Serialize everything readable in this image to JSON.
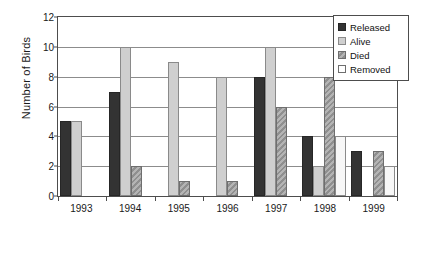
{
  "chart_data": {
    "type": "bar",
    "title": "",
    "xlabel": "",
    "ylabel": "Number of Birds",
    "categories": [
      "1993",
      "1994",
      "1995",
      "1996",
      "1997",
      "1998",
      "1999"
    ],
    "series": [
      {
        "name": "Released",
        "key": "released",
        "color": "#333333",
        "values": [
          5,
          7,
          0,
          0,
          8,
          4,
          3
        ]
      },
      {
        "name": "Alive",
        "key": "alive",
        "color": "#cfcfcf",
        "values": [
          5,
          10,
          9,
          8,
          10,
          2,
          0
        ]
      },
      {
        "name": "Died",
        "key": "died",
        "color": "#9b9b9b",
        "values": [
          0,
          2,
          1,
          1,
          6,
          8,
          3
        ]
      },
      {
        "name": "Removed",
        "key": "removed",
        "color": "#ffffff",
        "values": [
          0,
          0,
          0,
          0,
          0,
          4,
          2
        ]
      }
    ],
    "ylim": [
      0,
      12
    ],
    "yticks": [
      0,
      2,
      4,
      6,
      8,
      10,
      12
    ],
    "grid": true,
    "legend_position": "top-right"
  }
}
